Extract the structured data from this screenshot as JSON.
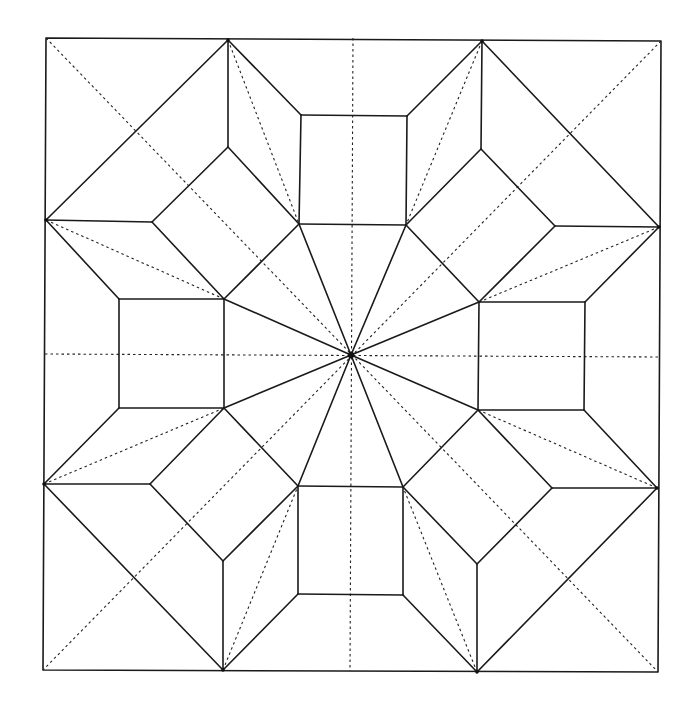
{
  "diagram": {
    "title": "Origami crease pattern",
    "canvas": {
      "width": 693,
      "height": 707,
      "background": "#ffffff"
    },
    "colors": {
      "mountain": "#1a1a1a",
      "valley": "#222222"
    },
    "legend": {
      "solid": "mountain fold",
      "dashed": "valley fold"
    },
    "center": [
      351,
      355
    ],
    "border": [
      [
        46,
        38
      ],
      [
        661,
        41
      ],
      [
        658,
        672
      ],
      [
        43,
        670
      ]
    ],
    "solid_lines": [
      [
        [
          228,
          40
        ],
        [
          46,
          220
        ]
      ],
      [
        [
          482,
          41
        ],
        [
          659,
          227
        ]
      ],
      [
        [
          44,
          484
        ],
        [
          223,
          670
        ]
      ],
      [
        [
          657,
          488
        ],
        [
          477,
          672
        ]
      ],
      [
        [
          228,
          40
        ],
        [
          228,
          147
        ]
      ],
      [
        [
          228,
          40
        ],
        [
          301,
          115
        ]
      ],
      [
        [
          482,
          41
        ],
        [
          481,
          149
        ]
      ],
      [
        [
          482,
          41
        ],
        [
          407,
          116
        ]
      ],
      [
        [
          46,
          220
        ],
        [
          152,
          222
        ]
      ],
      [
        [
          46,
          220
        ],
        [
          119,
          299
        ]
      ],
      [
        [
          659,
          227
        ],
        [
          555,
          226
        ]
      ],
      [
        [
          659,
          227
        ],
        [
          585,
          302
        ]
      ],
      [
        [
          44,
          484
        ],
        [
          150,
          484
        ]
      ],
      [
        [
          44,
          484
        ],
        [
          119,
          408
        ]
      ],
      [
        [
          657,
          488
        ],
        [
          552,
          488
        ]
      ],
      [
        [
          657,
          488
        ],
        [
          584,
          410
        ]
      ],
      [
        [
          223,
          670
        ],
        [
          223,
          561
        ]
      ],
      [
        [
          223,
          670
        ],
        [
          298,
          594
        ]
      ],
      [
        [
          477,
          672
        ],
        [
          477,
          564
        ]
      ],
      [
        [
          477,
          672
        ],
        [
          403,
          595
        ]
      ],
      [
        [
          301,
          115
        ],
        [
          407,
          116
        ]
      ],
      [
        [
          407,
          116
        ],
        [
          406,
          225
        ]
      ],
      [
        [
          406,
          225
        ],
        [
          299,
          224
        ]
      ],
      [
        [
          299,
          224
        ],
        [
          301,
          115
        ]
      ],
      [
        [
          119,
          299
        ],
        [
          224,
          299
        ]
      ],
      [
        [
          224,
          299
        ],
        [
          224,
          408
        ]
      ],
      [
        [
          224,
          408
        ],
        [
          119,
          408
        ]
      ],
      [
        [
          119,
          408
        ],
        [
          119,
          299
        ]
      ],
      [
        [
          479,
          302
        ],
        [
          585,
          302
        ]
      ],
      [
        [
          585,
          302
        ],
        [
          584,
          410
        ]
      ],
      [
        [
          584,
          410
        ],
        [
          478,
          410
        ]
      ],
      [
        [
          478,
          410
        ],
        [
          479,
          302
        ]
      ],
      [
        [
          298,
          486
        ],
        [
          403,
          487
        ]
      ],
      [
        [
          403,
          487
        ],
        [
          403,
          595
        ]
      ],
      [
        [
          403,
          595
        ],
        [
          298,
          594
        ]
      ],
      [
        [
          298,
          594
        ],
        [
          298,
          486
        ]
      ],
      [
        [
          228,
          147
        ],
        [
          152,
          222
        ]
      ],
      [
        [
          152,
          222
        ],
        [
          224,
          299
        ]
      ],
      [
        [
          224,
          299
        ],
        [
          299,
          224
        ]
      ],
      [
        [
          299,
          224
        ],
        [
          228,
          147
        ]
      ],
      [
        [
          481,
          149
        ],
        [
          555,
          226
        ]
      ],
      [
        [
          555,
          226
        ],
        [
          479,
          302
        ]
      ],
      [
        [
          479,
          302
        ],
        [
          406,
          225
        ]
      ],
      [
        [
          406,
          225
        ],
        [
          481,
          149
        ]
      ],
      [
        [
          150,
          484
        ],
        [
          224,
          408
        ]
      ],
      [
        [
          224,
          408
        ],
        [
          298,
          486
        ]
      ],
      [
        [
          298,
          486
        ],
        [
          223,
          561
        ]
      ],
      [
        [
          223,
          561
        ],
        [
          150,
          484
        ]
      ],
      [
        [
          552,
          488
        ],
        [
          478,
          410
        ]
      ],
      [
        [
          478,
          410
        ],
        [
          403,
          487
        ]
      ],
      [
        [
          403,
          487
        ],
        [
          477,
          564
        ]
      ],
      [
        [
          477,
          564
        ],
        [
          552,
          488
        ]
      ],
      [
        [
          351,
          355
        ],
        [
          299,
          224
        ]
      ],
      [
        [
          351,
          355
        ],
        [
          406,
          225
        ]
      ],
      [
        [
          351,
          355
        ],
        [
          479,
          302
        ]
      ],
      [
        [
          351,
          355
        ],
        [
          478,
          410
        ]
      ],
      [
        [
          351,
          355
        ],
        [
          403,
          487
        ]
      ],
      [
        [
          351,
          355
        ],
        [
          298,
          486
        ]
      ],
      [
        [
          351,
          355
        ],
        [
          224,
          408
        ]
      ],
      [
        [
          351,
          355
        ],
        [
          224,
          299
        ]
      ]
    ],
    "dashed_lines": [
      [
        [
          46,
          38
        ],
        [
          658,
          672
        ]
      ],
      [
        [
          661,
          41
        ],
        [
          43,
          670
        ]
      ],
      [
        [
          353,
          38
        ],
        [
          350,
          671
        ]
      ],
      [
        [
          45,
          354
        ],
        [
          660,
          357
        ]
      ],
      [
        [
          228,
          40
        ],
        [
          299,
          224
        ]
      ],
      [
        [
          482,
          41
        ],
        [
          406,
          225
        ]
      ],
      [
        [
          46,
          220
        ],
        [
          224,
          299
        ]
      ],
      [
        [
          44,
          484
        ],
        [
          224,
          408
        ]
      ],
      [
        [
          659,
          227
        ],
        [
          479,
          302
        ]
      ],
      [
        [
          657,
          488
        ],
        [
          478,
          410
        ]
      ],
      [
        [
          223,
          670
        ],
        [
          298,
          486
        ]
      ],
      [
        [
          477,
          672
        ],
        [
          403,
          487
        ]
      ]
    ],
    "vertex_dots": [
      [
        228,
        40
      ],
      [
        482,
        41
      ],
      [
        46,
        220
      ],
      [
        659,
        227
      ],
      [
        44,
        484
      ],
      [
        657,
        488
      ],
      [
        223,
        670
      ],
      [
        477,
        672
      ],
      [
        351,
        355
      ]
    ]
  }
}
